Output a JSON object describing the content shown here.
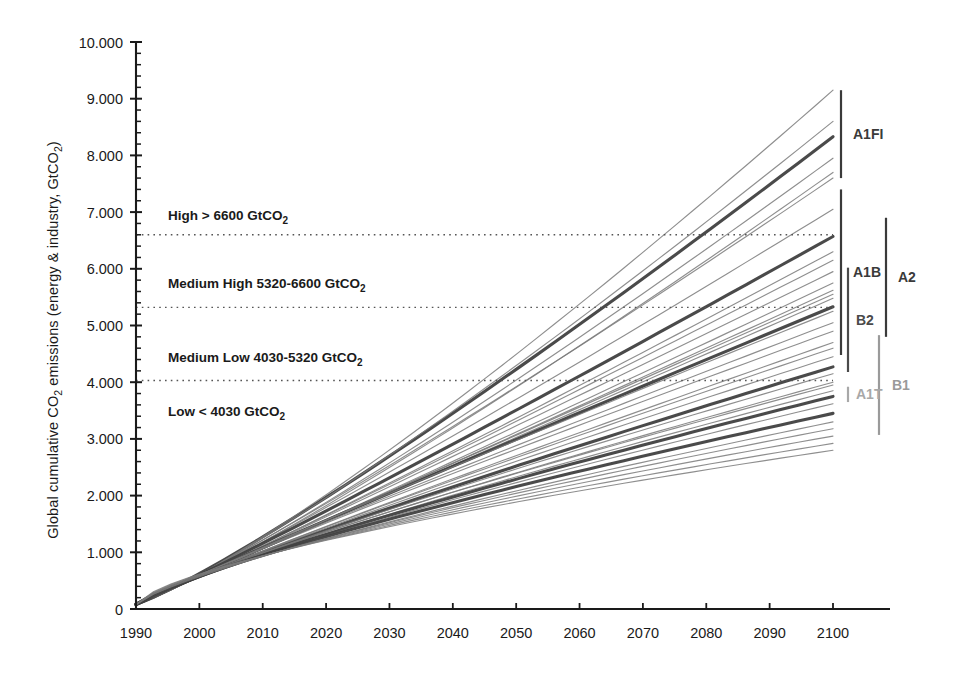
{
  "chart_data": {
    "type": "line",
    "title": "",
    "xlabel": "",
    "ylabel": "Global cumulative CO2 emissions (energy & industry, GtCO2)",
    "ylabel_parts": {
      "pre": "Global cumulative CO",
      "sub1": "2",
      "mid": " emissions (energy & industry, GtCO",
      "sub2": "2",
      "post": ")"
    },
    "xlim": [
      1990,
      2100
    ],
    "ylim": [
      0,
      10
    ],
    "grid": false,
    "legend_position": "right-brackets",
    "xticks": [
      1990,
      2000,
      2010,
      2020,
      2030,
      2040,
      2050,
      2060,
      2070,
      2080,
      2090,
      2100
    ],
    "xtick_labels": [
      "1990",
      "2000",
      "2010",
      "2020",
      "2030",
      "2040",
      "2050",
      "2060",
      "2070",
      "2080",
      "2090",
      "2100"
    ],
    "yticks": [
      0,
      1,
      2,
      3,
      4,
      5,
      6,
      7,
      8,
      9,
      10
    ],
    "ytick_labels": [
      "0",
      "1.000",
      "2.000",
      "3.000",
      "4.000",
      "5.000",
      "6.000",
      "7.000",
      "8.000",
      "9.000",
      "10.000"
    ],
    "ytick_minor_step": 0.2,
    "threshold_lines": [
      {
        "value": 6.6,
        "label": "High > 6600 GtCO2",
        "style": "dotted"
      },
      {
        "value": 5.32,
        "label": "Medium High 5320-6600 GtCO2",
        "style": "dotted"
      },
      {
        "value": 4.03,
        "label": "Medium Low 4030-5320 GtCO2",
        "style": "dotted"
      }
    ],
    "band_annotations": [
      {
        "text_pre": "High > 6600 GtCO",
        "sub": "2",
        "text_post": "",
        "y": 6.95
      },
      {
        "text_pre": "Medium High 5320-6600 GtCO",
        "sub": "2",
        "text_post": "",
        "y": 5.75
      },
      {
        "text_pre": "Medium Low 4030-5320 GtCO",
        "sub": "2",
        "text_post": "",
        "y": 4.45
      },
      {
        "text_pre": "Low < 4030 GtCO",
        "sub": "2",
        "text_post": "",
        "y": 3.5
      }
    ],
    "x_start": 1990,
    "x_end": 2100,
    "note": "All scenario trajectories start near 0 at 1990 and fan out monotonically to 2100. Values below are cumulative CO2 (1000 GtCO2 units) at 2100 endpoints; marker_type bold = illustrative marker scenario.",
    "series": [
      {
        "name": "A1FI-marker",
        "family": "A1FI",
        "weight": "bold",
        "end_value": 8.33,
        "curvature": 0.1
      },
      {
        "name": "A1FI-1",
        "family": "A1FI",
        "weight": "thin",
        "end_value": 9.15,
        "curvature": 0.14
      },
      {
        "name": "A1FI-2",
        "family": "A1FI",
        "weight": "thin",
        "end_value": 8.6,
        "curvature": 0.12
      },
      {
        "name": "A1FI-3",
        "family": "A1FI",
        "weight": "thin",
        "end_value": 7.95,
        "curvature": 0.1
      },
      {
        "name": "A1FI-4",
        "family": "A1FI",
        "weight": "thin",
        "end_value": 7.7,
        "curvature": 0.1
      },
      {
        "name": "A1FI-5",
        "family": "A1FI",
        "weight": "thin",
        "end_value": 7.6,
        "curvature": 0.08
      },
      {
        "name": "A1FI-6",
        "family": "A1FI",
        "weight": "thin",
        "end_value": 7.05,
        "curvature": 0.06
      },
      {
        "name": "A1B-marker",
        "family": "A1B",
        "weight": "bold",
        "end_value": 6.57,
        "curvature": 0.04
      },
      {
        "name": "A1B-1",
        "family": "A1B",
        "weight": "thin",
        "end_value": 6.3,
        "curvature": 0.04
      },
      {
        "name": "A1B-2",
        "family": "A1B",
        "weight": "thin",
        "end_value": 6.15,
        "curvature": 0.03
      },
      {
        "name": "A1B-3",
        "family": "A1B",
        "weight": "thin",
        "end_value": 5.95,
        "curvature": 0.02
      },
      {
        "name": "A1B-4",
        "family": "A1B",
        "weight": "thin",
        "end_value": 5.75,
        "curvature": 0.02
      },
      {
        "name": "A1B-5",
        "family": "A1B",
        "weight": "thin",
        "end_value": 5.62,
        "curvature": 0.01
      },
      {
        "name": "A1B-6",
        "family": "A1B",
        "weight": "thin",
        "end_value": 5.48,
        "curvature": 0.0
      },
      {
        "name": "A2-marker",
        "family": "A2",
        "weight": "bold",
        "end_value": 5.33,
        "curvature": -0.02
      },
      {
        "name": "A2-1",
        "family": "A2",
        "weight": "thin",
        "end_value": 5.55,
        "curvature": 0.0
      },
      {
        "name": "A2-2",
        "family": "A2",
        "weight": "thin",
        "end_value": 5.25,
        "curvature": -0.03
      },
      {
        "name": "A2-3",
        "family": "A2",
        "weight": "thin",
        "end_value": 5.05,
        "curvature": -0.04
      },
      {
        "name": "A2-4",
        "family": "A2",
        "weight": "thin",
        "end_value": 4.9,
        "curvature": -0.05
      },
      {
        "name": "A2-5",
        "family": "A2",
        "weight": "thin",
        "end_value": 4.7,
        "curvature": -0.05
      },
      {
        "name": "B2-marker",
        "family": "B2",
        "weight": "bold",
        "end_value": 4.27,
        "curvature": -0.08
      },
      {
        "name": "B2-1",
        "family": "B2",
        "weight": "thin",
        "end_value": 4.6,
        "curvature": -0.06
      },
      {
        "name": "B2-2",
        "family": "B2",
        "weight": "thin",
        "end_value": 4.45,
        "curvature": -0.07
      },
      {
        "name": "B2-3",
        "family": "B2",
        "weight": "thin",
        "end_value": 4.15,
        "curvature": -0.09
      },
      {
        "name": "B2-4",
        "family": "B2",
        "weight": "thin",
        "end_value": 4.0,
        "curvature": -0.1
      },
      {
        "name": "B2-5",
        "family": "B2",
        "weight": "thin",
        "end_value": 3.85,
        "curvature": -0.11
      },
      {
        "name": "A1T-marker",
        "family": "A1T",
        "weight": "bold",
        "end_value": 3.75,
        "curvature": -0.12
      },
      {
        "name": "A1T-1",
        "family": "A1T",
        "weight": "thin",
        "end_value": 3.95,
        "curvature": -0.11
      },
      {
        "name": "A1T-2",
        "family": "A1T",
        "weight": "thin",
        "end_value": 3.62,
        "curvature": -0.13
      },
      {
        "name": "B1-marker",
        "family": "B1",
        "weight": "bold",
        "end_value": 3.45,
        "curvature": -0.15
      },
      {
        "name": "B1-1",
        "family": "B1",
        "weight": "thin",
        "end_value": 3.3,
        "curvature": -0.16
      },
      {
        "name": "B1-2",
        "family": "B1",
        "weight": "thin",
        "end_value": 3.18,
        "curvature": -0.18
      },
      {
        "name": "B1-3",
        "family": "B1",
        "weight": "thin",
        "end_value": 3.05,
        "curvature": -0.2
      },
      {
        "name": "B1-4",
        "family": "B1",
        "weight": "thin",
        "end_value": 2.92,
        "curvature": -0.22
      },
      {
        "name": "B1-5",
        "family": "B1",
        "weight": "thin",
        "end_value": 2.8,
        "curvature": -0.24
      }
    ],
    "family_brackets": [
      {
        "label": "A1FI",
        "top_value": 9.15,
        "bottom_value": 7.6,
        "color": "#3a3a3a",
        "column": 0
      },
      {
        "label": "A1B",
        "top_value": 7.4,
        "bottom_value": 4.48,
        "color": "#3a3a3a",
        "column": 0
      },
      {
        "label": "A2",
        "top_value": 6.9,
        "bottom_value": 4.8,
        "color": "#3a3a3a",
        "column": 2
      },
      {
        "label": "B2",
        "top_value": 6.02,
        "bottom_value": 4.18,
        "color": "#4a4a4a",
        "column": 1
      },
      {
        "label": "B1",
        "top_value": 4.83,
        "bottom_value": 3.07,
        "color": "#9a9a9a",
        "column": 3
      },
      {
        "label": "A1T",
        "top_value": 3.92,
        "bottom_value": 3.65,
        "color": "#a8a8a8",
        "column": 1
      }
    ]
  },
  "colors": {
    "axis": "#1a1a1a",
    "text": "#1a1a1a",
    "line_bold": "#404040",
    "line_thin": "#7a7a7a",
    "dotted": "#555555",
    "bracket_dark": "#3a3a3a",
    "bracket_light": "#a8a8a8",
    "background": "#ffffff"
  }
}
